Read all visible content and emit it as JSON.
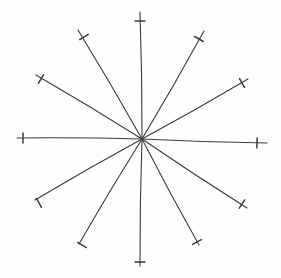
{
  "diagram": {
    "type": "hand-drawn-starburst",
    "width": 281,
    "height": 278,
    "background": "#fefefe",
    "stroke_color": "#3a3a3a",
    "stroke_width": 1.1,
    "tick_length": 10,
    "center": {
      "x": 142,
      "y": 139
    },
    "rays": [
      {
        "id": "ray-top",
        "end": {
          "x": 140,
          "y": 12
        },
        "tick": {
          "x": 140,
          "y": 21
        }
      },
      {
        "id": "ray-upper-right-steep",
        "end": {
          "x": 204,
          "y": 31
        },
        "tick": {
          "x": 199,
          "y": 39
        }
      },
      {
        "id": "ray-upper-right-shallow",
        "end": {
          "x": 248,
          "y": 79
        },
        "tick": {
          "x": 242,
          "y": 83
        }
      },
      {
        "id": "ray-right",
        "end": {
          "x": 267,
          "y": 143
        },
        "tick": {
          "x": 257,
          "y": 143
        }
      },
      {
        "id": "ray-lower-right-shallow",
        "end": {
          "x": 247,
          "y": 208
        },
        "tick": {
          "x": 242,
          "y": 204
        }
      },
      {
        "id": "ray-lower-right-steep",
        "end": {
          "x": 199,
          "y": 245
        },
        "tick": {
          "x": 197,
          "y": 242
        }
      },
      {
        "id": "ray-bottom",
        "end": {
          "x": 140,
          "y": 266
        },
        "tick": {
          "x": 140,
          "y": 262
        }
      },
      {
        "id": "ray-lower-left-steep",
        "end": {
          "x": 79,
          "y": 244
        },
        "tick": {
          "x": 82,
          "y": 245
        }
      },
      {
        "id": "ray-lower-left-shallow",
        "end": {
          "x": 35,
          "y": 200
        },
        "tick": {
          "x": 39,
          "y": 203
        }
      },
      {
        "id": "ray-left",
        "end": {
          "x": 17,
          "y": 138
        },
        "tick": {
          "x": 23,
          "y": 138
        }
      },
      {
        "id": "ray-upper-left-shallow",
        "end": {
          "x": 36,
          "y": 75
        },
        "tick": {
          "x": 41,
          "y": 79
        }
      },
      {
        "id": "ray-upper-left-steep",
        "end": {
          "x": 78,
          "y": 30
        },
        "tick": {
          "x": 84,
          "y": 37
        }
      }
    ]
  }
}
